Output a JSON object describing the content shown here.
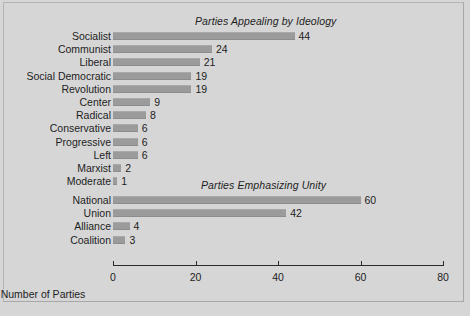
{
  "figure": {
    "background_color": "#d6d6d6",
    "bar_color": "#9b9b9b",
    "axis_color": "#2a2a2a",
    "text_color": "#1d1d1d"
  },
  "chart_data": [
    {
      "type": "bar",
      "orientation": "horizontal",
      "title": "Parties Appealing by Ideology",
      "xlabel": "",
      "ylabel": "",
      "categories": [
        "Socialist",
        "Communist",
        "Liberal",
        "Social Democratic",
        "Revolution",
        "Center",
        "Radical",
        "Conservative",
        "Progressive",
        "Left",
        "Marxist",
        "Moderate"
      ],
      "values": [
        44,
        24,
        21,
        19,
        19,
        9,
        8,
        6,
        6,
        6,
        2,
        1
      ],
      "value_labels": [
        "44",
        "24",
        "21",
        "19",
        "19",
        "9",
        "8",
        "6",
        "6",
        "6",
        "2",
        "1"
      ],
      "xlim": [
        0,
        80
      ],
      "grid": false,
      "legend": null
    },
    {
      "type": "bar",
      "orientation": "horizontal",
      "title": "Parties Emphasizing Unity",
      "xlabel": "Number of Parties",
      "ylabel": "",
      "categories": [
        "National",
        "Union",
        "Alliance",
        "Coalition"
      ],
      "values": [
        60,
        42,
        4,
        3
      ],
      "value_labels": [
        "60",
        "42",
        "4",
        "3"
      ],
      "xlim": [
        0,
        80
      ],
      "xticks": [
        0,
        20,
        40,
        60,
        80
      ],
      "xticklabels": [
        "0",
        "20",
        "40",
        "60",
        "80"
      ],
      "grid": false,
      "legend": null
    }
  ],
  "axis": {
    "label": "Number of Parties",
    "ticks": [
      "0",
      "20",
      "40",
      "60",
      "80"
    ]
  }
}
